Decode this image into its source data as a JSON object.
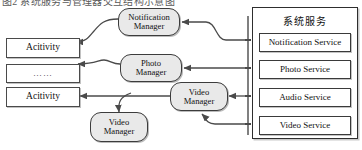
{
  "caption_strip": {
    "text": "图2 系统服务与管理器交互结构示意图"
  },
  "diagram": {
    "colors": {
      "node_fill": "#e9e9e9",
      "box_fill": "#ffffff",
      "stroke": "#3a3a3a",
      "panel_stroke": "#2e2e2e",
      "text": "#111111"
    },
    "activities": [
      {
        "id": "activity-top",
        "label": "Acitivity"
      },
      {
        "id": "activity-ellipsis",
        "label": "……"
      },
      {
        "id": "activity-bottom",
        "label": "Acitivity"
      }
    ],
    "managers": [
      {
        "id": "notification-manager",
        "line1": "Notification",
        "line2": "Manager"
      },
      {
        "id": "photo-manager",
        "line1": "Photo",
        "line2": "Manager"
      },
      {
        "id": "video-manager",
        "line1": "Video",
        "line2": "Manager"
      },
      {
        "id": "video-manager-secondary",
        "line1": "Video",
        "line2": "Manager"
      }
    ],
    "system_services": {
      "title": "系统服务",
      "items": [
        {
          "id": "notification-service",
          "label": "Notification Service"
        },
        {
          "id": "photo-service",
          "label": "Photo Service"
        },
        {
          "id": "audio-service",
          "label": "Audio Service"
        },
        {
          "id": "video-service",
          "label": "Video Service"
        }
      ]
    },
    "connections": [
      {
        "from": "activity-top",
        "to": "notification-manager",
        "style": "bidirectional-curve"
      },
      {
        "from": "notification-service",
        "to": "notification-manager",
        "style": "curve-arrow"
      },
      {
        "from": "activity-ellipsis",
        "to": "photo-manager",
        "style": "bidirectional-curve"
      },
      {
        "from": "photo-service",
        "to": "photo-manager",
        "style": "straight-arrow"
      },
      {
        "from": "activity-bottom",
        "to": "video-manager",
        "style": "bidirectional-line"
      },
      {
        "from": "activity-bottom",
        "to": "video-manager-secondary",
        "style": "branch-down-arrow"
      },
      {
        "from": "audio-service",
        "to": "video-manager",
        "style": "straight-arrow"
      },
      {
        "from": "video-service",
        "to": "video-manager",
        "style": "curve-arrow-up"
      }
    ]
  }
}
